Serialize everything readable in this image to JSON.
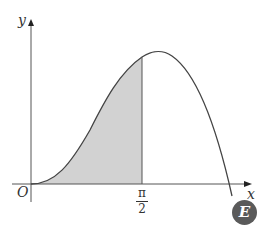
{
  "diagram": {
    "axes": {
      "x_label": "x",
      "y_label": "y",
      "origin_label": "O"
    },
    "tick": {
      "numerator": "π",
      "denominator": "2"
    },
    "badge": "E",
    "colors": {
      "curve": "#444444",
      "shade": "#d2d2d2",
      "axis": "#555555",
      "badge": "#5a5a5a"
    },
    "shaded_region": "area under curve from x = 0 to x = π/2"
  }
}
